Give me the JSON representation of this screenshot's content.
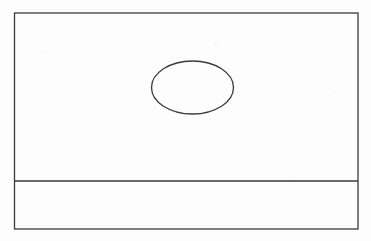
{
  "figure": {
    "canvas": {
      "width": 371,
      "height": 241,
      "background_color": "#fdfdfd"
    },
    "style": {
      "stroke_color": "#3a3a3a",
      "stroke_width": 1.3,
      "fill": "none"
    },
    "shapes": [
      {
        "id": "outer-rectangle",
        "type": "rect",
        "label": "Outer frame",
        "x": 14.5,
        "y": 13.0,
        "width": 343.5,
        "height": 216.0,
        "stroke_color": "#3a3a3a",
        "stroke_width": 1.3,
        "fill": "none"
      },
      {
        "id": "horizontal-divider",
        "type": "line",
        "label": "Horizontal divider",
        "x1": 14.5,
        "y1": 181.0,
        "x2": 358.0,
        "y2": 181.0,
        "stroke_color": "#3a3a3a",
        "stroke_width": 1.3
      },
      {
        "id": "ellipse",
        "type": "ellipse",
        "label": "Ellipse",
        "cx": 192.5,
        "cy": 87.5,
        "rx": 41.0,
        "ry": 26.5,
        "stroke_color": "#3a3a3a",
        "stroke_width": 1.3,
        "fill": "none"
      }
    ],
    "regions": [
      {
        "id": "upper-compartment",
        "label": "Upper compartment",
        "bounds": {
          "x": 14.5,
          "y": 13.0,
          "width": 343.5,
          "height": 168.0
        }
      },
      {
        "id": "lower-strip",
        "label": "Lower strip",
        "bounds": {
          "x": 14.5,
          "y": 181.0,
          "width": 343.5,
          "height": 48.0
        }
      }
    ],
    "text_content": []
  }
}
